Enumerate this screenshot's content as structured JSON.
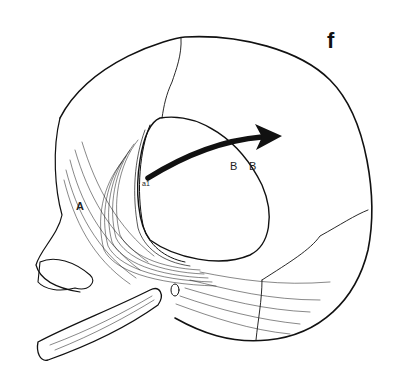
{
  "figure": {
    "panel_label": "f",
    "labels": {
      "a": "A",
      "b1": "B",
      "b2": "B",
      "flap_mark": "a1"
    },
    "colors": {
      "ink": "#111111",
      "background": "#ffffff"
    },
    "elements": [
      "skull-outline",
      "coronal-suture",
      "bone-flap",
      "temporalis-muscle",
      "mandible",
      "curved-arrow"
    ]
  }
}
